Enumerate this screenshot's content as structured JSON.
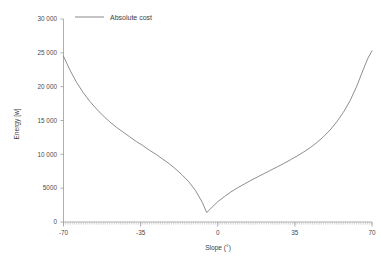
{
  "chart_data": {
    "type": "line",
    "title": "",
    "xlabel": "Slope (°)",
    "ylabel": "Energy [w]",
    "xlim": [
      -70,
      70
    ],
    "ylim": [
      0,
      30000
    ],
    "xticks": [
      -70,
      -35,
      0,
      35,
      70
    ],
    "xtick_labels": [
      "-70",
      "-35",
      "0",
      "35",
      "70"
    ],
    "yticks": [
      0,
      5000,
      10000,
      15000,
      20000,
      25000,
      30000
    ],
    "ytick_labels": [
      "0",
      "5000",
      "10 000",
      "15 000",
      "20 000",
      "25 000",
      "30 000"
    ],
    "grid": false,
    "legend_position": "top-left",
    "legend": [
      "Absolute cost"
    ],
    "series": [
      {
        "name": "Absolute cost",
        "color": "#7a7a7a",
        "x": [
          -70,
          -67,
          -64,
          -61,
          -58,
          -55,
          -52,
          -49,
          -46,
          -43,
          -40,
          -37,
          -34,
          -31,
          -28,
          -25,
          -22,
          -19,
          -16,
          -13,
          -10,
          -7,
          -5,
          -3,
          0,
          3,
          6,
          9,
          12,
          15,
          18,
          21,
          24,
          27,
          30,
          33,
          36,
          39,
          42,
          45,
          48,
          51,
          54,
          57,
          60,
          63,
          66,
          68,
          70
        ],
        "y": [
          24500,
          22400,
          20600,
          19100,
          17800,
          16700,
          15700,
          14800,
          14000,
          13300,
          12600,
          11900,
          11300,
          10600,
          10000,
          9300,
          8600,
          7800,
          6900,
          5900,
          4600,
          2900,
          1400,
          2050,
          3000,
          3750,
          4450,
          5050,
          5600,
          6150,
          6650,
          7150,
          7650,
          8150,
          8650,
          9200,
          9750,
          10350,
          11000,
          11750,
          12600,
          13600,
          14800,
          16200,
          17900,
          20000,
          22500,
          24100,
          25300
        ]
      }
    ]
  },
  "axis": {
    "x_axis_name": "slope-axis",
    "y_axis_name": "energy-axis"
  }
}
